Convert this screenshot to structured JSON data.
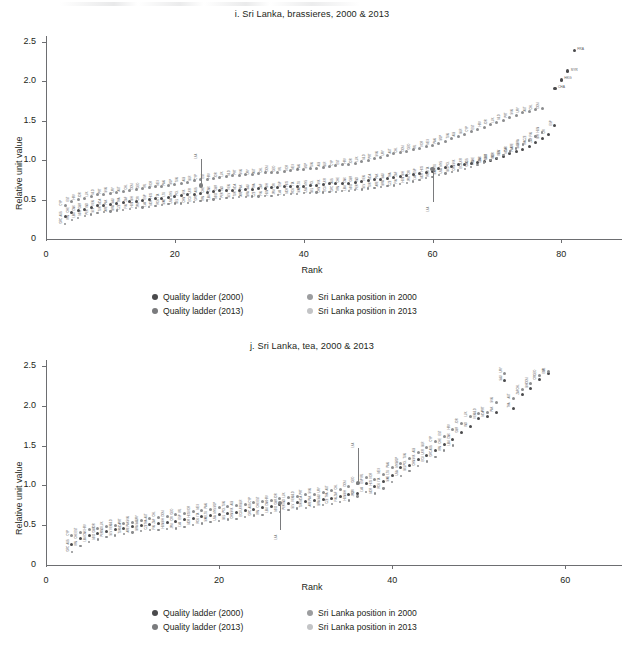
{
  "figure": {
    "panels": [
      {
        "id": "i",
        "title": "i. Sri Lanka, brassieres, 2000 & 2013",
        "xlabel": "Rank",
        "ylabel": "Relative unit value",
        "xticks": [
          "0",
          "20",
          "40",
          "60",
          "80"
        ],
        "yticks": [
          "0",
          "0.5",
          "1.0",
          "1.5",
          "2.0",
          "2.5"
        ]
      },
      {
        "id": "j",
        "title": "j. Sri Lanka, tea, 2000 & 2013",
        "xlabel": "Rank",
        "ylabel": "Relative unit value",
        "xticks": [
          "0",
          "20",
          "40",
          "60"
        ],
        "yticks": [
          "0",
          "0.5",
          "1.0",
          "1.5",
          "2.0",
          "2.5"
        ]
      }
    ],
    "legend": {
      "items": [
        {
          "label": "Quality ladder (2000)",
          "color": "#4a4a4c"
        },
        {
          "label": "Sri Lanka position in 2000",
          "color": "#9c9d9f"
        },
        {
          "label": "Quality ladder (2013)",
          "color": "#7a7b7d"
        },
        {
          "label": "Sri Lanka position in 2013",
          "color": "#c3c4c6"
        }
      ]
    }
  },
  "chart_data": [
    {
      "type": "scatter",
      "id": "i",
      "title": "i. Sri Lanka, brassieres, 2000 & 2013",
      "xlabel": "Rank",
      "ylabel": "Relative unit value",
      "xlim": [
        0,
        86
      ],
      "ylim": [
        0,
        2.5
      ],
      "xticks": [
        0,
        20,
        40,
        60,
        80
      ],
      "yticks": [
        0,
        0.5,
        1.0,
        1.5,
        2.0,
        2.5
      ],
      "grid": false,
      "legend_position": "below-axis-center",
      "series": [
        {
          "name": "Quality ladder (2000)",
          "color": "#4a4a4c",
          "x": [
            3,
            4,
            5,
            6,
            7,
            8,
            9,
            10,
            11,
            12,
            13,
            14,
            15,
            16,
            17,
            18,
            19,
            20,
            21,
            22,
            23,
            24,
            25,
            26,
            27,
            28,
            29,
            30,
            31,
            32,
            33,
            34,
            35,
            36,
            37,
            38,
            39,
            40,
            41,
            42,
            43,
            44,
            45,
            46,
            47,
            48,
            49,
            50,
            51,
            52,
            53,
            54,
            55,
            56,
            57,
            58,
            59,
            60,
            61,
            62,
            63,
            64,
            65,
            66,
            67,
            68,
            69,
            70,
            71,
            72,
            73,
            74,
            75,
            76,
            77,
            78,
            79
          ],
          "y": [
            0.28,
            0.33,
            0.36,
            0.38,
            0.4,
            0.42,
            0.43,
            0.44,
            0.45,
            0.46,
            0.47,
            0.48,
            0.49,
            0.5,
            0.51,
            0.52,
            0.53,
            0.54,
            0.55,
            0.56,
            0.57,
            0.58,
            0.59,
            0.6,
            0.61,
            0.61,
            0.62,
            0.62,
            0.63,
            0.63,
            0.64,
            0.64,
            0.65,
            0.65,
            0.66,
            0.66,
            0.67,
            0.67,
            0.68,
            0.68,
            0.69,
            0.7,
            0.7,
            0.71,
            0.71,
            0.72,
            0.73,
            0.74,
            0.75,
            0.76,
            0.77,
            0.78,
            0.79,
            0.8,
            0.82,
            0.83,
            0.85,
            0.86,
            0.89,
            0.91,
            0.92,
            0.94,
            0.95,
            0.96,
            0.97,
            0.98,
            1.0,
            1.02,
            1.05,
            1.08,
            1.11,
            1.14,
            1.18,
            1.22,
            1.27,
            1.33,
            1.44
          ]
        },
        {
          "name": "Quality ladder (2013)",
          "color": "#8b8c8e",
          "x": [
            3,
            4,
            5,
            6,
            7,
            8,
            9,
            10,
            11,
            12,
            13,
            14,
            15,
            16,
            17,
            18,
            19,
            20,
            21,
            22,
            23,
            24,
            25,
            26,
            27,
            28,
            29,
            30,
            31,
            32,
            33,
            34,
            35,
            36,
            37,
            38,
            39,
            40,
            41,
            42,
            43,
            44,
            45,
            46,
            47,
            48,
            49,
            50,
            51,
            52,
            53,
            54,
            55,
            56,
            57,
            58,
            59,
            60,
            61,
            62,
            63,
            64,
            65,
            66,
            67,
            68,
            69,
            70,
            71,
            72,
            73,
            74,
            75,
            76,
            77
          ],
          "y": [
            0.42,
            0.47,
            0.5,
            0.52,
            0.54,
            0.56,
            0.57,
            0.58,
            0.59,
            0.6,
            0.62,
            0.63,
            0.64,
            0.65,
            0.66,
            0.67,
            0.68,
            0.69,
            0.71,
            0.72,
            0.74,
            0.75,
            0.76,
            0.77,
            0.78,
            0.79,
            0.8,
            0.81,
            0.82,
            0.82,
            0.83,
            0.84,
            0.85,
            0.85,
            0.86,
            0.87,
            0.88,
            0.88,
            0.89,
            0.9,
            0.91,
            0.92,
            0.93,
            0.94,
            0.95,
            0.96,
            0.98,
            1.0,
            1.02,
            1.04,
            1.06,
            1.08,
            1.1,
            1.11,
            1.13,
            1.15,
            1.17,
            1.19,
            1.21,
            1.24,
            1.27,
            1.3,
            1.33,
            1.36,
            1.39,
            1.42,
            1.45,
            1.48,
            1.51,
            1.54,
            1.57,
            1.6,
            1.62,
            1.64,
            1.65
          ]
        },
        {
          "name": "Quality ladder (2000) lower tail",
          "color": "#8b8c8e",
          "x": [
            3,
            4,
            5,
            6,
            7,
            8,
            9,
            10,
            11,
            12,
            13,
            14,
            15,
            16,
            17,
            18,
            19,
            20,
            21,
            22,
            23,
            24,
            25,
            26,
            27,
            28,
            29,
            30,
            31,
            32,
            33,
            34,
            35,
            36,
            37,
            38,
            39,
            40,
            41,
            42,
            43,
            44,
            45,
            46,
            47,
            48,
            49,
            50,
            51,
            52,
            53,
            54,
            55,
            56,
            57,
            58,
            59,
            60,
            61,
            62,
            63,
            64,
            65,
            66,
            67,
            68,
            69,
            70,
            71,
            72,
            73,
            74,
            75,
            76,
            77
          ],
          "y": [
            0.19,
            0.24,
            0.27,
            0.29,
            0.31,
            0.33,
            0.34,
            0.35,
            0.36,
            0.37,
            0.38,
            0.39,
            0.4,
            0.41,
            0.42,
            0.43,
            0.44,
            0.45,
            0.45,
            0.46,
            0.47,
            0.48,
            0.49,
            0.5,
            0.51,
            0.52,
            0.52,
            0.53,
            0.53,
            0.54,
            0.54,
            0.55,
            0.55,
            0.56,
            0.56,
            0.57,
            0.57,
            0.58,
            0.58,
            0.59,
            0.59,
            0.6,
            0.6,
            0.61,
            0.61,
            0.62,
            0.63,
            0.64,
            0.65,
            0.66,
            0.67,
            0.68,
            0.7,
            0.71,
            0.73,
            0.75,
            0.77,
            0.79,
            0.81,
            0.83,
            0.85,
            0.87,
            0.89,
            0.91,
            0.94,
            0.97,
            1.0,
            1.03,
            1.07,
            1.11,
            1.15,
            1.2,
            1.25,
            1.3,
            1.35
          ]
        },
        {
          "name": "Top outliers",
          "color": "#4a4a4c",
          "x": [
            79,
            80,
            81,
            82
          ],
          "y": [
            1.91,
            2.02,
            2.13,
            2.39
          ],
          "labels": [
            "CHA",
            "HKG",
            "SYR",
            "FRA"
          ]
        }
      ],
      "sri_lanka": [
        {
          "rank": 24,
          "y_2000": 0.68,
          "y_2013": 1.02,
          "direction": "up"
        },
        {
          "rank": 60,
          "y_2000": 0.89,
          "y_2013": 0.47,
          "direction": "down"
        }
      ]
    },
    {
      "type": "scatter",
      "id": "j",
      "title": "j. Sri Lanka, tea, 2000 & 2013",
      "xlabel": "Rank",
      "ylabel": "Relative unit value",
      "xlim": [
        0,
        64
      ],
      "ylim": [
        0,
        2.5
      ],
      "xticks": [
        0,
        20,
        40,
        60
      ],
      "yticks": [
        0,
        0.5,
        1.0,
        1.5,
        2.0,
        2.5
      ],
      "grid": false,
      "legend_position": "below-axis-center",
      "series": [
        {
          "name": "Quality ladder (2000)",
          "color": "#4a4a4c",
          "x": [
            3,
            4,
            5,
            6,
            7,
            8,
            9,
            10,
            11,
            12,
            13,
            14,
            15,
            16,
            17,
            18,
            19,
            20,
            21,
            22,
            23,
            24,
            25,
            26,
            27,
            28,
            29,
            30,
            31,
            32,
            33,
            34,
            35,
            36,
            37,
            38,
            39,
            40,
            41,
            42,
            43,
            44,
            45,
            46,
            47,
            48,
            49,
            50,
            51,
            52,
            53,
            54,
            55,
            56,
            57,
            58
          ],
          "y": [
            0.26,
            0.33,
            0.37,
            0.4,
            0.42,
            0.44,
            0.46,
            0.48,
            0.5,
            0.51,
            0.52,
            0.53,
            0.55,
            0.57,
            0.59,
            0.61,
            0.62,
            0.64,
            0.65,
            0.66,
            0.68,
            0.7,
            0.72,
            0.74,
            0.76,
            0.77,
            0.79,
            0.8,
            0.81,
            0.82,
            0.84,
            0.86,
            0.88,
            0.9,
            1.02,
            0.99,
            1.05,
            1.13,
            1.22,
            1.25,
            1.32,
            1.38,
            1.44,
            1.52,
            1.58,
            1.66,
            1.74,
            1.84,
            1.86,
            1.92,
            2.32,
            1.97,
            2.14,
            2.22,
            2.33,
            2.4
          ]
        },
        {
          "name": "Quality ladder (2013)",
          "color": "#8b8c8e",
          "x": [
            3,
            4,
            5,
            6,
            7,
            8,
            9,
            10,
            11,
            12,
            13,
            14,
            15,
            16,
            17,
            18,
            19,
            20,
            21,
            22,
            23,
            24,
            25,
            26,
            27,
            28,
            29,
            30,
            31,
            32,
            33,
            34,
            35,
            36,
            37,
            38,
            39,
            40,
            41,
            42,
            43,
            44,
            45,
            46,
            47,
            48,
            49,
            50,
            51,
            52,
            53,
            54,
            55,
            56,
            57,
            58
          ],
          "y": [
            0.37,
            0.41,
            0.44,
            0.46,
            0.48,
            0.5,
            0.52,
            0.54,
            0.56,
            0.58,
            0.6,
            0.61,
            0.63,
            0.65,
            0.67,
            0.69,
            0.7,
            0.72,
            0.73,
            0.75,
            0.76,
            0.78,
            0.8,
            0.81,
            0.83,
            0.85,
            0.86,
            0.88,
            0.89,
            0.91,
            0.93,
            0.95,
            0.98,
            1.03,
            1.1,
            1.08,
            1.14,
            1.22,
            1.28,
            1.34,
            1.41,
            1.48,
            1.55,
            1.62,
            1.7,
            1.78,
            1.86,
            1.9,
            1.92,
            2.04,
            2.41,
            2.09,
            2.2,
            2.28,
            2.38,
            2.43
          ]
        },
        {
          "name": "Lower tail",
          "color": "#8b8c8e",
          "x": [
            3,
            4,
            5,
            6,
            7,
            8,
            9,
            10,
            11,
            12,
            13,
            14,
            15,
            16,
            17,
            18,
            19,
            20,
            21,
            22,
            23,
            24,
            25,
            26,
            27,
            28,
            29,
            30,
            31,
            32,
            33,
            34,
            35,
            36,
            37,
            38,
            39,
            40,
            41,
            42,
            43,
            44,
            45,
            46,
            47
          ],
          "y": [
            0.16,
            0.24,
            0.29,
            0.32,
            0.35,
            0.37,
            0.39,
            0.41,
            0.43,
            0.44,
            0.44,
            0.45,
            0.46,
            0.48,
            0.5,
            0.52,
            0.54,
            0.55,
            0.57,
            0.58,
            0.6,
            0.62,
            0.63,
            0.65,
            0.67,
            0.69,
            0.71,
            0.72,
            0.73,
            0.75,
            0.77,
            0.79,
            0.81,
            0.86,
            0.92,
            0.9,
            0.96,
            1.04,
            1.12,
            1.18,
            1.24,
            1.3,
            1.36,
            1.44,
            1.5
          ]
        }
      ],
      "sri_lanka": [
        {
          "rank": 27,
          "y_2000": 0.78,
          "y_2013": 0.44,
          "direction": "down"
        },
        {
          "rank": 36,
          "y_2000": 1.03,
          "y_2013": 1.47,
          "direction": "up"
        }
      ]
    }
  ]
}
